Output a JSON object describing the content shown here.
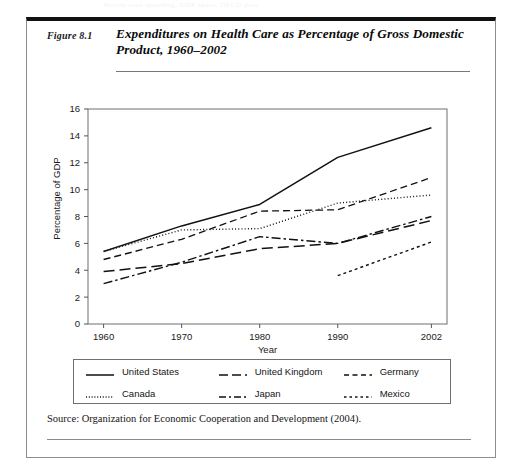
{
  "ghost_text": "Health care spending, GDP share, OECD data",
  "figure": {
    "number_label": "Figure 8.1",
    "title": "Expenditures on Health Care as Percentage of Gross Domestic Product, 1960–2002",
    "source": "Source: Organization for Economic Cooperation and Development (2004)."
  },
  "legend": {
    "items": [
      {
        "label": "United States",
        "style": "solid"
      },
      {
        "label": "United Kingdom",
        "style": "long-dash"
      },
      {
        "label": "Germany",
        "style": "dash"
      },
      {
        "label": "Canada",
        "style": "dotted"
      },
      {
        "label": "Japan",
        "style": "dash-dot"
      },
      {
        "label": "Mexico",
        "style": "fine-dash"
      }
    ]
  },
  "chart_data": {
    "type": "line",
    "title": "Expenditures on Health Care as Percentage of Gross Domestic Product, 1960–2002",
    "xlabel": "Year",
    "ylabel": "Percentage of GDP",
    "xlim": [
      1958,
      2004
    ],
    "ylim": [
      0,
      16
    ],
    "xticks": [
      1960,
      1970,
      1980,
      1990,
      2002
    ],
    "xtick_labels": [
      "1960",
      "1970",
      "1980",
      "1990",
      "2002"
    ],
    "yticks": [
      0,
      2,
      4,
      6,
      8,
      10,
      12,
      14,
      16
    ],
    "ytick_labels": [
      "0",
      "2",
      "4",
      "6",
      "8",
      "10",
      "12",
      "14",
      "16"
    ],
    "grid": false,
    "legend_position": "below-plot",
    "series": [
      {
        "name": "United States",
        "style": "solid",
        "x": [
          1960,
          1970,
          1980,
          1990,
          2002
        ],
        "values": [
          5.4,
          7.3,
          8.9,
          12.4,
          14.6
        ]
      },
      {
        "name": "United Kingdom",
        "style": "long-dash",
        "x": [
          1960,
          1970,
          1980,
          1990,
          2002
        ],
        "values": [
          3.9,
          4.5,
          5.6,
          6.0,
          7.7
        ]
      },
      {
        "name": "Germany",
        "style": "dash",
        "x": [
          1960,
          1970,
          1980,
          1990,
          2002
        ],
        "values": [
          4.8,
          6.3,
          8.4,
          8.5,
          10.9
        ]
      },
      {
        "name": "Canada",
        "style": "dotted",
        "x": [
          1960,
          1970,
          1980,
          1990,
          2002
        ],
        "values": [
          5.4,
          7.0,
          7.1,
          9.0,
          9.6
        ]
      },
      {
        "name": "Japan",
        "style": "dash-dot",
        "x": [
          1960,
          1970,
          1980,
          1990,
          2002
        ],
        "values": [
          3.0,
          4.6,
          6.5,
          6.0,
          8.0
        ]
      },
      {
        "name": "Mexico",
        "style": "fine-dash",
        "x": [
          1990,
          2002
        ],
        "values": [
          3.6,
          6.1
        ]
      }
    ]
  }
}
